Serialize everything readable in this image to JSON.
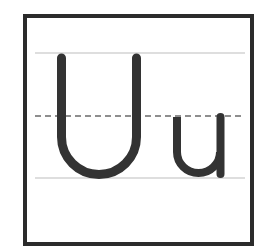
{
  "card": {
    "title": "Uu",
    "uppercase_letter": "U",
    "lowercase_letter": "u"
  },
  "colors": {
    "border": "#2b2b2b",
    "letter": "#333333",
    "guide_line": "#bdbdbd",
    "dashed_line": "#6a6a6a",
    "background": "#ffffff"
  }
}
